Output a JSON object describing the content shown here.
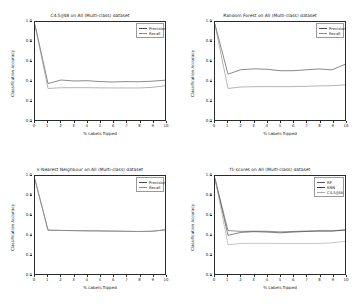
{
  "figure": {
    "axis_color": "#2b2b2b",
    "background": "#ffffff"
  },
  "labels": {
    "xlabel": "% Labels flipped",
    "ylabel": "Classification Accuracy",
    "yticks": [
      "1.0",
      "0.8",
      "0.6",
      "0.4",
      "0.2",
      "0.0"
    ],
    "xticks": [
      "0",
      "1",
      "2",
      "3",
      "4",
      "5",
      "6",
      "7",
      "8",
      "9",
      "10"
    ]
  },
  "chart_data": [
    {
      "type": "line",
      "panel": "top-left",
      "title": "C4.5/J48 on All (Multi-class) dataset",
      "xlabel": "% Labels flipped",
      "ylabel": "Classification Accuracy",
      "xlim": [
        0,
        10
      ],
      "ylim": [
        0.0,
        1.0
      ],
      "grid": false,
      "legend_position": "upper right",
      "x": [
        0,
        1,
        2,
        3,
        4,
        5,
        6,
        7,
        8,
        9,
        10
      ],
      "series": [
        {
          "name": "Precision",
          "color": "#4a4a4a",
          "values": [
            0.97,
            0.372,
            0.408,
            0.398,
            0.401,
            0.392,
            0.388,
            0.392,
            0.39,
            0.396,
            0.406
          ]
        },
        {
          "name": "Recall",
          "color": "#8c8c8c",
          "values": [
            0.97,
            0.322,
            0.329,
            0.33,
            0.33,
            0.328,
            0.327,
            0.327,
            0.327,
            0.333,
            0.349
          ]
        }
      ]
    },
    {
      "type": "line",
      "panel": "top-right",
      "title": "Random Forest on All (Multi-class) dataset",
      "xlabel": "% Labels flipped",
      "ylabel": "Classification Accuracy",
      "xlim": [
        0,
        10
      ],
      "ylim": [
        0.0,
        1.0
      ],
      "grid": false,
      "legend_position": "upper right",
      "x": [
        0,
        1,
        2,
        3,
        4,
        5,
        6,
        7,
        8,
        9,
        10
      ],
      "series": [
        {
          "name": "Precision",
          "color": "#4a4a4a",
          "values": [
            0.975,
            0.468,
            0.513,
            0.522,
            0.518,
            0.503,
            0.503,
            0.512,
            0.521,
            0.512,
            0.568
          ]
        },
        {
          "name": "Recall",
          "color": "#8c8c8c",
          "values": [
            0.975,
            0.322,
            0.337,
            0.34,
            0.341,
            0.34,
            0.341,
            0.344,
            0.348,
            0.35,
            0.358
          ]
        }
      ]
    },
    {
      "type": "line",
      "panel": "bottom-left",
      "title": "k-Nearest Neighbour on All (Multi-class) dataset",
      "xlabel": "% Labels flipped",
      "ylabel": "Classification Accuracy",
      "xlim": [
        0,
        10
      ],
      "ylim": [
        0.0,
        1.0
      ],
      "grid": false,
      "legend_position": "upper right",
      "x": [
        0,
        1,
        2,
        3,
        4,
        5,
        6,
        7,
        8,
        9,
        10
      ],
      "series": [
        {
          "name": "Precision",
          "color": "#4a4a4a",
          "values": [
            0.963,
            0.447,
            0.445,
            0.443,
            0.441,
            0.44,
            0.438,
            0.436,
            0.434,
            0.436,
            0.45
          ]
        },
        {
          "name": "Recall",
          "color": "#8c8c8c",
          "values": [
            0.963,
            0.447,
            0.444,
            0.442,
            0.44,
            0.439,
            0.437,
            0.435,
            0.433,
            0.436,
            0.451
          ]
        }
      ]
    },
    {
      "type": "line",
      "panel": "bottom-right",
      "title": "f1-scores on All (Multi-class) dataset",
      "xlabel": "% Labels flipped",
      "ylabel": "Classification Accuracy",
      "xlim": [
        0,
        10
      ],
      "ylim": [
        0.0,
        1.0
      ],
      "grid": false,
      "legend_position": "upper right",
      "x": [
        0,
        1,
        2,
        3,
        4,
        5,
        6,
        7,
        8,
        9,
        10
      ],
      "series": [
        {
          "name": "RF",
          "color": "#5a5a5a",
          "values": [
            0.972,
            0.443,
            0.435,
            0.437,
            0.436,
            0.43,
            0.434,
            0.438,
            0.441,
            0.44,
            0.45
          ]
        },
        {
          "name": "KNN",
          "color": "#3d3d3d",
          "values": [
            0.972,
            0.395,
            0.425,
            0.432,
            0.428,
            0.42,
            0.428,
            0.434,
            0.438,
            0.438,
            0.448
          ]
        },
        {
          "name": "C4.5/J48",
          "color": "#a8a8a8",
          "values": [
            0.972,
            0.298,
            0.312,
            0.313,
            0.313,
            0.311,
            0.311,
            0.311,
            0.312,
            0.318,
            0.333
          ]
        }
      ]
    }
  ]
}
